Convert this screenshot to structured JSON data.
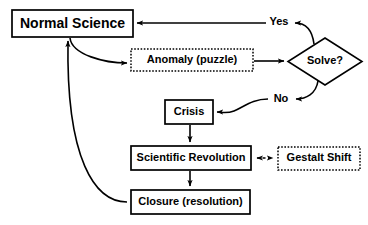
{
  "diagram": {
    "background_color": "#ffffff",
    "line_color": "#000000",
    "nodes": [
      {
        "id": "normal_science",
        "label": "Normal Science",
        "shape": "rect",
        "border": "solid",
        "x": 12,
        "y": 10,
        "w": 121,
        "h": 27,
        "font_size": 14
      },
      {
        "id": "anomaly",
        "label": "Anomaly (puzzle)",
        "shape": "rect",
        "border": "dotted",
        "x": 131,
        "y": 49,
        "w": 122,
        "h": 22,
        "font_size": 11
      },
      {
        "id": "solve",
        "label": "Solve?",
        "shape": "diamond",
        "border": "solid",
        "x": 288,
        "y": 38,
        "w": 74,
        "h": 47,
        "font_size": 11
      },
      {
        "id": "crisis",
        "label": "Crisis",
        "shape": "rect",
        "border": "solid",
        "x": 165,
        "y": 100,
        "w": 48,
        "h": 24,
        "font_size": 11
      },
      {
        "id": "scientific_revolution",
        "label": "Scientific Revolution",
        "shape": "rect",
        "border": "solid",
        "x": 131,
        "y": 146,
        "w": 120,
        "h": 24,
        "font_size": 11
      },
      {
        "id": "gestalt_shift",
        "label": "Gestalt Shift",
        "shape": "rect",
        "border": "dotted",
        "x": 278,
        "y": 147,
        "w": 82,
        "h": 23,
        "font_size": 11
      },
      {
        "id": "closure",
        "label": "Closure (resolution)",
        "shape": "rect",
        "border": "solid",
        "x": 131,
        "y": 190,
        "w": 119,
        "h": 24,
        "font_size": 11
      }
    ],
    "edge_labels": [
      {
        "id": "yes",
        "label": "Yes",
        "x": 279,
        "y": 21,
        "font_size": 11
      },
      {
        "id": "no",
        "label": "No",
        "x": 281,
        "y": 98,
        "font_size": 11
      }
    ],
    "edges": [
      {
        "id": "normal-to-anomaly",
        "from": "normal_science",
        "to": "anomaly",
        "style": "solid",
        "arrow": "end"
      },
      {
        "id": "anomaly-to-solve",
        "from": "anomaly",
        "to": "solve",
        "style": "solid",
        "arrow": "end"
      },
      {
        "id": "solve-yes-to-normal",
        "from": "solve",
        "to": "normal_science",
        "style": "solid",
        "arrow": "end",
        "label": "Yes"
      },
      {
        "id": "solve-no-to-crisis",
        "from": "solve",
        "to": "crisis",
        "style": "solid",
        "arrow": "end",
        "label": "No"
      },
      {
        "id": "crisis-to-revolution",
        "from": "crisis",
        "to": "scientific_revolution",
        "style": "solid",
        "arrow": "end"
      },
      {
        "id": "revolution-to-closure",
        "from": "scientific_revolution",
        "to": "closure",
        "style": "solid",
        "arrow": "end"
      },
      {
        "id": "revolution-gestalt",
        "from": "scientific_revolution",
        "to": "gestalt_shift",
        "style": "dashed",
        "arrow": "both"
      },
      {
        "id": "closure-to-normal",
        "from": "closure",
        "to": "normal_science",
        "style": "solid",
        "arrow": "end"
      }
    ]
  }
}
